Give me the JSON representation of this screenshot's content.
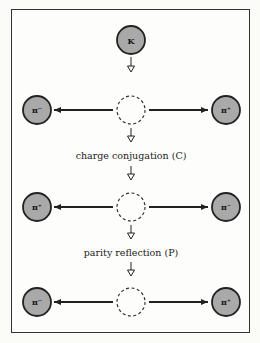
{
  "diagram": {
    "type": "CP symmetry of kaon decay",
    "initial_particle": "K",
    "steps": [
      {
        "left": "π⁻",
        "right": "π⁺"
      },
      {
        "left": "π⁺",
        "right": "π⁻"
      },
      {
        "left": "π⁻",
        "right": "π⁺"
      }
    ],
    "transformations": [
      "charge conjugation (C)",
      "parity reflection (P)"
    ],
    "colors": {
      "particle_fill": "#a9a9a9",
      "stroke": "#222222",
      "background": "#fdfdfb"
    }
  }
}
